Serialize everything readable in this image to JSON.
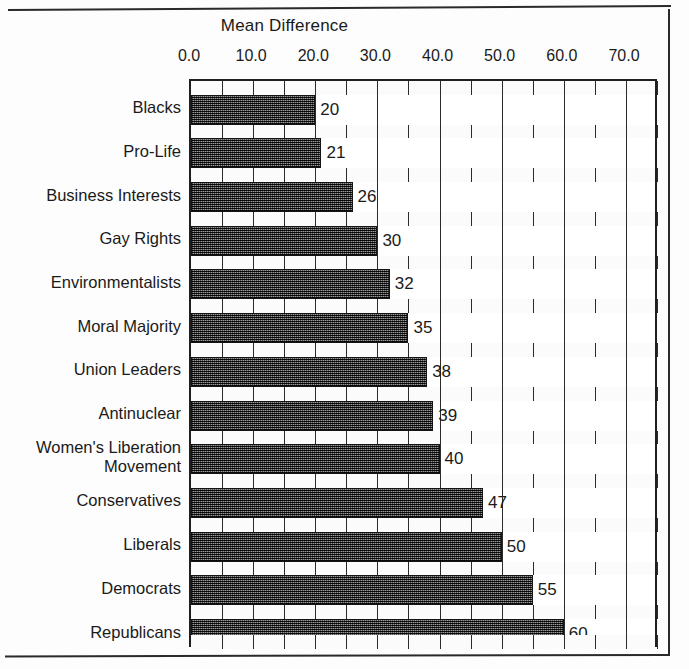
{
  "figure": {
    "title": "Mean Difference",
    "frame_color": "#2a2a2a"
  },
  "chart_data": {
    "type": "bar",
    "orientation": "horizontal",
    "title": "Mean Difference",
    "xlabel": "",
    "ylabel": "",
    "xlim": [
      0.0,
      75.0
    ],
    "xticks": [
      "0.0",
      "10.0",
      "20.0",
      "30.0",
      "40.0",
      "50.0",
      "60.0",
      "70.0"
    ],
    "xtick_values": [
      0,
      10,
      20,
      30,
      40,
      50,
      60,
      70
    ],
    "grid": true,
    "grid_interval": 5,
    "legend": "none",
    "categories": [
      "Blacks",
      "Pro-Life",
      "Business Interests",
      "Gay Rights",
      "Environmentalists",
      "Moral Majority",
      "Union Leaders",
      "Antinuclear",
      "Women's Liberation\nMovement",
      "Conservatives",
      "Liberals",
      "Democrats",
      "Republicans"
    ],
    "values": [
      20,
      21,
      26,
      30,
      32,
      35,
      38,
      39,
      40,
      47,
      50,
      55,
      60
    ],
    "data_labels": [
      "20",
      "21",
      "26",
      "30",
      "32",
      "35",
      "38",
      "39",
      "40",
      "47",
      "50",
      "55",
      "60"
    ],
    "bar_fill": "#3a3a3a",
    "bar_edge": "#141414"
  }
}
